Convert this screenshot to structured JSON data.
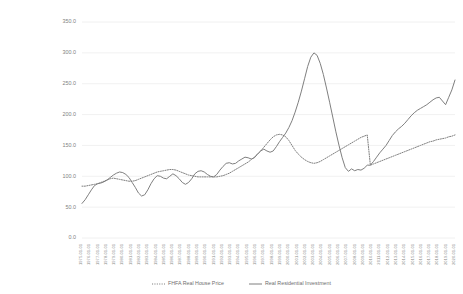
{
  "chart_data": {
    "type": "line",
    "title": "",
    "subtitle": "",
    "xlabel": "",
    "ylabel": "",
    "ylim": [
      0,
      350
    ],
    "yticks": [
      "0.0",
      "50.0",
      "100.0",
      "150.0",
      "200.0",
      "250.0",
      "300.0",
      "350.0"
    ],
    "ytick_values": [
      0,
      50,
      100,
      150,
      200,
      250,
      300,
      350
    ],
    "grid": true,
    "legend_position": "bottom",
    "x": [
      "1975-01-01",
      "1975-07-01",
      "1976-01-01",
      "1976-07-01",
      "1977-01-01",
      "1977-07-01",
      "1978-01-01",
      "1978-07-01",
      "1979-01-01",
      "1979-07-01",
      "1980-01-01",
      "1980-07-01",
      "1981-01-01",
      "1981-07-01",
      "1982-01-01",
      "1982-07-01",
      "1983-01-01",
      "1983-07-01",
      "1984-01-01",
      "1984-07-01",
      "1985-01-01",
      "1985-07-01",
      "1986-01-01",
      "1986-07-01",
      "1987-01-01",
      "1987-07-01",
      "1988-01-01",
      "1988-07-01",
      "1989-01-01",
      "1989-07-01",
      "1990-01-01",
      "1990-07-01",
      "1991-01-01",
      "1991-07-01",
      "1992-01-01",
      "1992-07-01",
      "1993-01-01",
      "1993-07-01",
      "1994-01-01",
      "1994-07-01",
      "1995-01-01",
      "1995-07-01",
      "1996-01-01",
      "1996-07-01",
      "1997-01-01",
      "1997-07-01",
      "1998-01-01",
      "1998-07-01",
      "1999-01-01",
      "1999-07-01",
      "2000-01-01",
      "2000-07-01",
      "2001-01-01",
      "2001-07-01",
      "2002-01-01",
      "2002-07-01",
      "2003-01-01",
      "2003-07-01",
      "2004-01-01",
      "2004-07-01",
      "2005-01-01",
      "2005-07-01",
      "2006-01-01",
      "2006-07-01",
      "2007-01-01",
      "2007-07-01",
      "2008-01-01",
      "2008-07-01",
      "2009-01-01",
      "2009-07-01",
      "2010-01-01",
      "2010-07-01",
      "2011-01-01",
      "2011-07-01",
      "2012-01-01",
      "2012-07-01",
      "2013-01-01",
      "2013-07-01",
      "2014-01-01",
      "2014-07-01",
      "2015-01-01",
      "2015-07-01",
      "2016-01-01",
      "2016-07-01",
      "2017-01-01",
      "2017-07-01",
      "2018-01-01",
      "2018-07-01",
      "2019-01-01",
      "2019-07-01",
      "2020-01-01",
      "2020-07-01"
    ],
    "xtick_labels": [
      "1975-01-01",
      "1976-01-01",
      "1977-01-01",
      "1978-01-01",
      "1979-01-01",
      "1980-01-01",
      "1981-01-01",
      "1982-01-01",
      "1983-01-01",
      "1984-01-01",
      "1985-01-01",
      "1986-01-01",
      "1987-01-01",
      "1988-01-01",
      "1989-01-01",
      "1990-01-01",
      "1991-01-01",
      "1992-01-01",
      "1993-01-01",
      "1994-01-01",
      "1995-01-01",
      "1996-01-01",
      "1997-01-01",
      "1998-01-01",
      "1999-01-01",
      "2000-01-01",
      "2001-01-01",
      "2002-01-01",
      "2003-01-01",
      "2004-01-01",
      "2005-01-01",
      "2006-01-01",
      "2007-01-01",
      "2008-01-01",
      "2009-01-01",
      "2010-01-01",
      "2011-01-01",
      "2012-01-01",
      "2013-01-01",
      "2014-01-01",
      "2015-01-01",
      "2016-01-01",
      "2017-01-01",
      "2018-01-01",
      "2019-01-01",
      "2020-01-01"
    ],
    "series": [
      {
        "name": "FHFA Real House Price",
        "style": "dotted",
        "color": "#7f7f7f",
        "values": [
          84,
          84,
          85,
          86,
          87,
          88,
          90,
          92,
          94,
          96,
          97,
          96,
          95,
          94,
          93,
          92,
          92,
          93,
          95,
          97,
          99,
          101,
          103,
          105,
          107,
          108,
          109,
          110,
          111,
          111,
          110,
          108,
          106,
          104,
          102,
          101,
          100,
          99,
          99,
          99,
          99,
          99,
          99,
          99,
          100,
          101,
          103,
          105,
          108,
          111,
          114,
          117,
          120,
          123,
          127,
          131,
          136,
          141,
          147,
          153,
          159,
          164,
          167,
          168,
          167,
          164,
          158,
          150,
          142,
          136,
          131,
          127,
          124,
          122,
          121,
          122,
          124,
          127,
          130,
          133,
          136,
          139,
          142,
          145,
          148,
          151,
          154,
          157,
          160,
          163,
          165,
          167
        ]
      },
      {
        "name": "Real Residential Investment",
        "style": "solid",
        "color": "#7f7f7f",
        "values": [
          56,
          62,
          70,
          78,
          85,
          88,
          89,
          91,
          94,
          98,
          102,
          105,
          107,
          106,
          103,
          98,
          90,
          82,
          73,
          68,
          70,
          78,
          88,
          96,
          101,
          100,
          97,
          96,
          100,
          104,
          101,
          96,
          90,
          87,
          90,
          96,
          104,
          108,
          109,
          107,
          103,
          100,
          99,
          103,
          110,
          116,
          121,
          122,
          120,
          121,
          125,
          128,
          131,
          130,
          128,
          130,
          136,
          141,
          144,
          141,
          139,
          141,
          148,
          156,
          163,
          170,
          179,
          190,
          204,
          220,
          238,
          258,
          278,
          293,
          300,
          296,
          283,
          265,
          243,
          220,
          196,
          172,
          150,
          130,
          114,
          108,
          112,
          109,
          111,
          110,
          113,
          118
        ]
      }
    ],
    "series_tail_note": "solid series continues rising to ~255 by end of range",
    "solid_tail_values": [
      118,
      124,
      131,
      138,
      144,
      150,
      158,
      166,
      172,
      177,
      181,
      186,
      192,
      198,
      203,
      207,
      210,
      213,
      216,
      220,
      224,
      227,
      228,
      222,
      216,
      228,
      240,
      256
    ],
    "dotted_tail_values": [
      118,
      120,
      122,
      124,
      126,
      128,
      130,
      132,
      134,
      136,
      138,
      140,
      142,
      144,
      146,
      148,
      150,
      152,
      154,
      156,
      157,
      159,
      160,
      161,
      162,
      164,
      165,
      167
    ]
  },
  "legend": {
    "items": [
      {
        "label": "FHFA Real House Price",
        "marker": "dotted-line-swatch"
      },
      {
        "label": "Real Residential Investment",
        "marker": "solid-line-swatch"
      }
    ]
  }
}
